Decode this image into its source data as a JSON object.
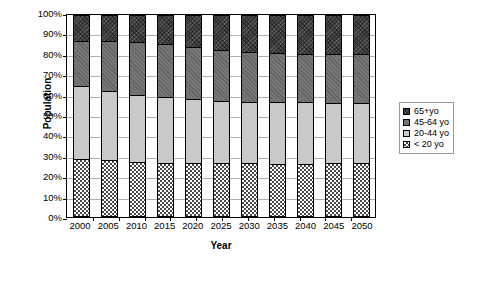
{
  "chart_data": {
    "type": "bar",
    "subtype": "100% stacked bar",
    "title": "",
    "xlabel": "Year",
    "ylabel": "Population",
    "categories": [
      "2000",
      "2005",
      "2010",
      "2015",
      "2020",
      "2025",
      "2030",
      "2035",
      "2040",
      "2045",
      "2050"
    ],
    "ylim": [
      0,
      100
    ],
    "ytick_labels": [
      "0%",
      "10%",
      "20%",
      "30%",
      "40%",
      "50%",
      "60%",
      "70%",
      "80%",
      "90%",
      "100%"
    ],
    "ytick_values": [
      0,
      10,
      20,
      30,
      40,
      50,
      60,
      70,
      80,
      90,
      100
    ],
    "grid": true,
    "legend_position": "right-outside",
    "series": [
      {
        "name": "< 20 yo",
        "pattern": "checkerboard",
        "color": "#4a4a4a",
        "values": [
          28.8,
          28.0,
          27.0,
          26.8,
          26.6,
          26.5,
          26.5,
          26.4,
          26.4,
          26.5,
          26.5
        ]
      },
      {
        "name": "20-44 yo",
        "pattern": "solid-light-gray",
        "color": "#c9c9c9",
        "values": [
          36.2,
          34.6,
          33.4,
          32.4,
          31.9,
          31.0,
          30.5,
          30.4,
          30.3,
          30.1,
          30.0
        ]
      },
      {
        "name": "45-64 yo",
        "pattern": "solid-medium-gray",
        "color": "#777777",
        "values": [
          22.0,
          24.4,
          26.1,
          26.3,
          25.5,
          25.0,
          24.5,
          24.2,
          23.8,
          23.9,
          24.0
        ]
      },
      {
        "name": "65+yo",
        "pattern": "crosshatch-dark",
        "color": "#3b3b3b",
        "values": [
          13.0,
          13.0,
          13.5,
          14.5,
          16.0,
          17.5,
          18.5,
          19.0,
          19.5,
          19.5,
          19.5
        ]
      }
    ]
  },
  "legend": {
    "items": [
      {
        "label": "65+yo"
      },
      {
        "label": "45-64 yo"
      },
      {
        "label": "20-44 yo"
      },
      {
        "label": "< 20 yo"
      }
    ]
  }
}
